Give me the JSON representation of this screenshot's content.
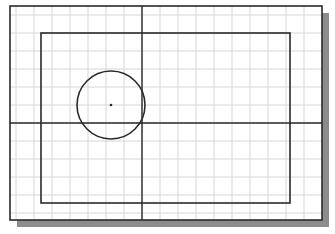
{
  "figure": {
    "grid": {
      "spacing": 18,
      "origin_x": 142,
      "origin_y": 123,
      "color": "#d6d6d6"
    },
    "sheet": {
      "x": 10,
      "y": 6,
      "width": 312,
      "height": 214,
      "stroke": "#2a2a2a",
      "shadow_color": "#8c8c8c",
      "shadow_offset": 7
    },
    "rectangle": {
      "x": 41,
      "y": 33,
      "width": 249,
      "height": 170,
      "stroke": "#2a2a2a"
    },
    "circle": {
      "cx": 111,
      "cy": 105,
      "r": 34,
      "stroke": "#2a2a2a",
      "center_point": true
    },
    "crosshair": {
      "vertical_x": 142,
      "horizontal_y": 123,
      "stroke": "#2a2a2a"
    }
  }
}
